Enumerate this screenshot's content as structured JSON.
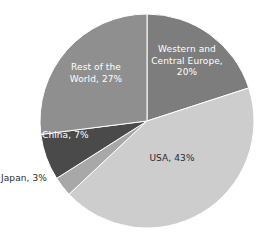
{
  "title_fragment": "",
  "chart_data": {
    "type": "pie",
    "title": "",
    "subtitle": "",
    "xlabel": "",
    "ylabel": "",
    "grid": false,
    "legend": "none",
    "units": "percent",
    "start_angle_deg": 0,
    "direction": "clockwise",
    "center": {
      "x": 147,
      "y": 121
    },
    "radius": 107,
    "categories": [
      "Western and Central Europe",
      "USA",
      "Japan",
      "China",
      "Rest of the World"
    ],
    "values": [
      20,
      43,
      3,
      7,
      27
    ],
    "colors": [
      "#7d7d7d",
      "#cdcdcd",
      "#a8a8a8",
      "#4a4a4a",
      "#8f8f8f"
    ],
    "slices": [
      {
        "name": "Western and Central Europe",
        "value": 20,
        "label": "Western and\nCentral Europe,\n20%",
        "color": "#7d7d7d",
        "label_color": "#ffffff",
        "label_placement": "inside",
        "start_deg": 0,
        "end_deg": 72
      },
      {
        "name": "USA",
        "value": 43,
        "label": "USA, 43%",
        "color": "#cdcdcd",
        "label_color": "#2b2b2b",
        "label_placement": "inside",
        "start_deg": 72,
        "end_deg": 226.8
      },
      {
        "name": "Japan",
        "value": 3,
        "label": "Japan, 3%",
        "color": "#a8a8a8",
        "label_color": "#2b2b2b",
        "label_placement": "outside",
        "start_deg": 226.8,
        "end_deg": 237.6
      },
      {
        "name": "China",
        "value": 7,
        "label": "China, 7%",
        "color": "#4a4a4a",
        "label_color": "#ffffff",
        "label_placement": "inside",
        "start_deg": 237.6,
        "end_deg": 262.8
      },
      {
        "name": "Rest of the World",
        "value": 27,
        "label": "Rest of the\nWorld, 27%",
        "color": "#8f8f8f",
        "label_color": "#ffffff",
        "label_placement": "inside",
        "start_deg": 262.8,
        "end_deg": 360
      }
    ]
  },
  "labels": {
    "europe": "Western and\nCentral Europe,\n20%",
    "usa": "USA, 43%",
    "japan": "Japan, 3%",
    "china": "China, 7%",
    "rest_of_world": "Rest of the\nWorld, 27%"
  }
}
